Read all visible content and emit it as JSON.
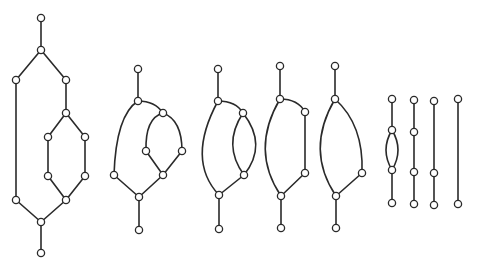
{
  "diagram": {
    "colors": {
      "stroke": "#2a2a2a",
      "node_fill": "#ffffff",
      "background": "#ffffff"
    },
    "node_radius": 3.6,
    "graphs": [
      {
        "id": "g1",
        "nodes": [
          [
            41,
            18
          ],
          [
            41,
            50
          ],
          [
            16,
            80
          ],
          [
            66,
            80
          ],
          [
            66,
            113
          ],
          [
            48,
            137
          ],
          [
            85,
            137
          ],
          [
            48,
            176
          ],
          [
            85,
            176
          ],
          [
            16,
            200
          ],
          [
            66,
            200
          ],
          [
            41,
            222
          ],
          [
            41,
            253
          ]
        ],
        "edges": [
          {
            "d": "M41,18 L41,50"
          },
          {
            "d": "M41,50 L16,80"
          },
          {
            "d": "M41,50 L66,80"
          },
          {
            "d": "M16,80 L16,200"
          },
          {
            "d": "M66,80 L66,113"
          },
          {
            "d": "M66,113 L48,137"
          },
          {
            "d": "M66,113 L85,137"
          },
          {
            "d": "M48,137 L48,176"
          },
          {
            "d": "M85,137 L85,176"
          },
          {
            "d": "M48,176 L66,200"
          },
          {
            "d": "M85,176 L66,200"
          },
          {
            "d": "M16,200 L41,222"
          },
          {
            "d": "M66,200 L41,222"
          },
          {
            "d": "M41,222 L41,253"
          }
        ]
      },
      {
        "id": "g2",
        "nodes": [
          [
            138,
            69
          ],
          [
            138,
            101
          ],
          [
            163,
            113
          ],
          [
            146,
            151
          ],
          [
            182,
            151
          ],
          [
            114,
            175
          ],
          [
            163,
            175
          ],
          [
            139,
            197
          ],
          [
            139,
            230
          ]
        ],
        "edges": [
          {
            "d": "M138,69 L138,101"
          },
          {
            "d": "M138,101 Q155,101 163,113"
          },
          {
            "d": "M138,101 Q116,115 114,175"
          },
          {
            "d": "M163,113 Q145,118 146,151"
          },
          {
            "d": "M163,113 Q182,120 182,151"
          },
          {
            "d": "M146,151 L163,175"
          },
          {
            "d": "M182,151 L163,175"
          },
          {
            "d": "M114,175 L139,197"
          },
          {
            "d": "M163,175 L139,197"
          },
          {
            "d": "M139,197 L139,230"
          }
        ]
      },
      {
        "id": "g3",
        "nodes": [
          [
            218,
            69
          ],
          [
            218,
            101
          ],
          [
            243,
            113
          ],
          [
            244,
            175
          ],
          [
            219,
            195
          ],
          [
            219,
            229
          ]
        ],
        "edges": [
          {
            "d": "M218,69 L218,101"
          },
          {
            "d": "M218,101 Q236,101 243,113"
          },
          {
            "d": "M218,101 Q186,160 219,195"
          },
          {
            "d": "M243,113 Q222,145 244,175"
          },
          {
            "d": "M243,113 Q268,145 244,175"
          },
          {
            "d": "M244,175 L219,195"
          },
          {
            "d": "M219,195 L219,229"
          }
        ]
      },
      {
        "id": "g4",
        "nodes": [
          [
            280,
            66
          ],
          [
            280,
            99
          ],
          [
            305,
            112
          ],
          [
            305,
            173
          ],
          [
            281,
            196
          ],
          [
            281,
            228
          ]
        ],
        "edges": [
          {
            "d": "M280,66 L280,99"
          },
          {
            "d": "M280,99 Q298,99 305,112"
          },
          {
            "d": "M280,99 Q250,150 281,196"
          },
          {
            "d": "M305,112 L305,173"
          },
          {
            "d": "M305,173 L281,196"
          },
          {
            "d": "M281,196 L281,228"
          }
        ]
      },
      {
        "id": "g5",
        "nodes": [
          [
            335,
            66
          ],
          [
            335,
            99
          ],
          [
            362,
            173
          ],
          [
            336,
            196
          ],
          [
            336,
            228
          ]
        ],
        "edges": [
          {
            "d": "M335,66 L335,99"
          },
          {
            "d": "M335,99 Q364,125 362,173"
          },
          {
            "d": "M335,99 Q305,150 336,196"
          },
          {
            "d": "M362,173 L336,196"
          },
          {
            "d": "M336,196 L336,228"
          }
        ]
      },
      {
        "id": "g6",
        "nodes": [
          [
            392,
            99
          ],
          [
            392,
            130
          ],
          [
            392,
            170
          ],
          [
            392,
            203
          ]
        ],
        "edges": [
          {
            "d": "M392,99 L392,130"
          },
          {
            "d": "M392,130 Q380,150 392,170"
          },
          {
            "d": "M392,130 Q404,150 392,170"
          },
          {
            "d": "M392,170 L392,203"
          }
        ]
      },
      {
        "id": "g7",
        "nodes": [
          [
            414,
            100
          ],
          [
            414,
            132
          ],
          [
            414,
            172
          ],
          [
            414,
            204
          ]
        ],
        "edges": [
          {
            "d": "M414,100 L414,132"
          },
          {
            "d": "M414,132 L414,172"
          },
          {
            "d": "M414,172 L414,204"
          }
        ]
      },
      {
        "id": "g8",
        "nodes": [
          [
            434,
            101
          ],
          [
            434,
            173
          ],
          [
            434,
            205
          ]
        ],
        "edges": [
          {
            "d": "M434,101 L434,173"
          },
          {
            "d": "M434,173 L434,205"
          }
        ]
      },
      {
        "id": "g9",
        "nodes": [
          [
            458,
            99
          ],
          [
            458,
            204
          ]
        ],
        "edges": [
          {
            "d": "M458,99 L458,204"
          }
        ]
      }
    ]
  }
}
